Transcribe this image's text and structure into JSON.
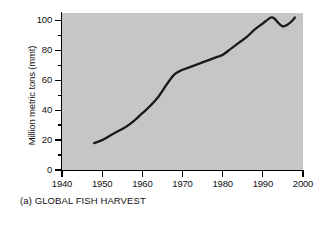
{
  "chart_data": {
    "type": "line",
    "title": "",
    "caption": "(a) GLOBAL FISH HARVEST",
    "xlabel": "",
    "ylabel": "Million metric tons (mmt)",
    "xlim": [
      1940,
      2000
    ],
    "ylim": [
      0,
      105
    ],
    "grid": false,
    "legend": null,
    "x_ticks": [
      1940,
      1950,
      1960,
      1970,
      1980,
      1990,
      2000
    ],
    "x_tick_labels": [
      "1940",
      "1950",
      "1960",
      "1970",
      "1980",
      "1990",
      "2000"
    ],
    "y_ticks": [
      0,
      20,
      40,
      60,
      80,
      100
    ],
    "y_tick_labels": [
      "0",
      "20",
      "40",
      "60",
      "80",
      "100"
    ],
    "y_minor_ticks": [
      10,
      30,
      50,
      70,
      90
    ],
    "series": [
      {
        "name": "Global fish harvest",
        "color": "#1a1a1a",
        "x": [
          1948,
          1950,
          1952,
          1954,
          1956,
          1958,
          1960,
          1962,
          1964,
          1966,
          1968,
          1970,
          1972,
          1974,
          1976,
          1978,
          1980,
          1982,
          1984,
          1986,
          1988,
          1990,
          1992,
          1993,
          1994,
          1995,
          1996,
          1997,
          1998
        ],
        "values": [
          18,
          20,
          23,
          26,
          29,
          33,
          38,
          43,
          49,
          57,
          64,
          67,
          69,
          71,
          73,
          75,
          77,
          81,
          85,
          89,
          94,
          98,
          102,
          101,
          98,
          96,
          97,
          99,
          102
        ]
      }
    ],
    "colors": {
      "plot_background": "#c6c6c6",
      "line": "#1a1a1a",
      "axis": "#000000",
      "text": "#111111",
      "figure_background": "#ffffff"
    }
  }
}
